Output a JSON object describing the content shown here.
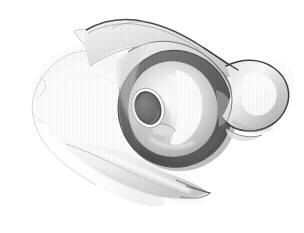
{
  "figure": {
    "title": "Scapula, lateral oblique view",
    "view": "lateral-oblique",
    "style": "grayscale-pencil-shaded-anatomical-illustration",
    "background_color": "#ffffff",
    "canvas": {
      "width": 304,
      "height": 233
    },
    "labels": [],
    "annotations": [],
    "palette": {
      "background": "#ffffff",
      "outline_dark": "#3a3a3a",
      "outline_mid": "#6e6e6e",
      "outline_faint": "#c9c9c9",
      "glenoid_rim_dark": "#6b6b6b",
      "glenoid_rim_darkest": "#4f4f4f",
      "foramen_fill": "#717171",
      "bone_light": "#f2f2f2",
      "bone_mid": "#dcdcdc",
      "bone_shadow": "#b4b4b4",
      "highlight_white": "#ffffff"
    },
    "structures": [
      {
        "id": "scapular-body",
        "name": "Scapular body (blade)",
        "region": "left and lower-left of image",
        "shading": "very pale, faint outline only"
      },
      {
        "id": "scapular-spine",
        "name": "Spine of scapula",
        "region": "upper band running from upper-left to upper-right",
        "shading": "light gray with darker superior border"
      },
      {
        "id": "glenoid-cavity",
        "name": "Glenoid cavity (fossa)",
        "region": "center-right, pear-shaped depression",
        "shading": "bright highlight center with dark encircling rim"
      },
      {
        "id": "glenoid-rim",
        "name": "Glenoid rim / labrum ring",
        "region": "dark crescent encircling glenoid, heaviest inferiorly",
        "shading": "dark gray hatched band"
      },
      {
        "id": "suprascapular-notch-foramen",
        "name": "Foramen / notch opening",
        "region": "dark ellipse left of glenoid center",
        "shading": "solid mid-gray with white highlight ring"
      },
      {
        "id": "coracoid-process",
        "name": "Coracoid / acromial process",
        "region": "right-hand bulbous projection",
        "shading": "light with bright specular highlight"
      },
      {
        "id": "lateral-border",
        "name": "Lateral border / infraglenoid tubercle",
        "region": "lower band sweeping down-left from glenoid",
        "shading": "pale with soft gray edge"
      }
    ]
  }
}
